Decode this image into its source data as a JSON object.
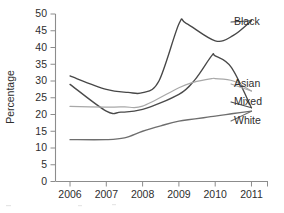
{
  "chart_data": {
    "type": "line",
    "title": "",
    "xlabel": "",
    "ylabel": "Percentage",
    "x": [
      2006,
      2007,
      2008,
      2009,
      2010,
      2011
    ],
    "xtick_labels": [
      "2006",
      "2007",
      "2008",
      "2009",
      "2010",
      "2011"
    ],
    "ytick_labels": [
      "0",
      "5",
      "10",
      "15",
      "20",
      "25",
      "30",
      "35",
      "40",
      "45",
      "50"
    ],
    "ytick_values": [
      0,
      5,
      10,
      15,
      20,
      25,
      30,
      35,
      40,
      45,
      50
    ],
    "xlim": [
      2005.6,
      2011.4
    ],
    "ylim": [
      0,
      50
    ],
    "grid": false,
    "legend_position": "line-end-labels",
    "series": [
      {
        "name": "Black",
        "label": "Black",
        "color": "#474747",
        "values": [
          31.5,
          27.5,
          26.5,
          47.0,
          42.0,
          48.0
        ],
        "peak_value": 47.2,
        "peak_x": 2009.2
      },
      {
        "name": "Mixed",
        "label": "Mixed",
        "color": "#4a4a4a",
        "values": [
          29.0,
          21.0,
          21.5,
          26.0,
          37.5,
          22.0
        ],
        "peak_value": 37.5,
        "peak_x": 2009.9
      },
      {
        "name": "Asian",
        "label": "Asian",
        "color": "#a8a8a8",
        "values": [
          22.4,
          22.2,
          22.5,
          28.0,
          30.7,
          27.0
        ],
        "peak_value": 30.7,
        "peak_x": 2009.9
      },
      {
        "name": "White",
        "label": "White",
        "color": "#6e6e6e",
        "values": [
          12.5,
          12.5,
          15.0,
          18.0,
          19.5,
          21.0
        ],
        "peak_value": 21.0,
        "peak_x": 2011
      }
    ]
  }
}
